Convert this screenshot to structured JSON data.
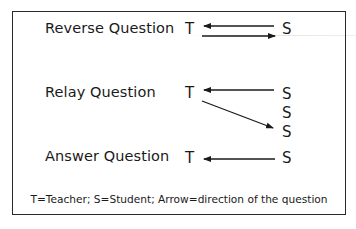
{
  "diagram": {
    "rows": [
      {
        "label": "Reverse Question",
        "teacher": "T",
        "students": [
          "S"
        ],
        "arrows": [
          {
            "from": "S",
            "to": "T",
            "direction": "left"
          },
          {
            "from": "T",
            "to": "S",
            "direction": "right"
          }
        ]
      },
      {
        "label": "Relay Question",
        "teacher": "T",
        "students": [
          "S",
          "S",
          "S"
        ],
        "arrows": [
          {
            "from": "S1",
            "to": "T",
            "direction": "left"
          },
          {
            "from": "T",
            "to": "S3",
            "direction": "down-right"
          }
        ]
      },
      {
        "label": "Answer Question",
        "teacher": "T",
        "students": [
          "S"
        ],
        "arrows": [
          {
            "from": "S",
            "to": "T",
            "direction": "left"
          }
        ]
      }
    ],
    "caption": "T=Teacher; S=Student; Arrow=direction of the question",
    "colors": {
      "ink": "#1a1a1a",
      "border": "#2a2a2a",
      "background": "#ffffff"
    }
  }
}
